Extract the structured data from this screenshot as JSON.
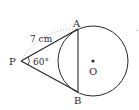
{
  "diagram": {
    "type": "geometry-tangents-to-circle",
    "points": {
      "P": {
        "label": "P",
        "x": 21,
        "y": 61
      },
      "A": {
        "label": "A",
        "x": 78,
        "y": 29
      },
      "B": {
        "label": "B",
        "x": 78,
        "y": 92
      },
      "O": {
        "label": "O",
        "x": 93,
        "y": 61
      }
    },
    "circle": {
      "cx": 93,
      "cy": 61,
      "r": 35
    },
    "labels": {
      "length_PA": "7 cm",
      "angle_P": "60°"
    },
    "colors": {
      "stroke": "#2a2a2a",
      "dotted": "#9a9a9a",
      "background": "#ffffff"
    }
  }
}
